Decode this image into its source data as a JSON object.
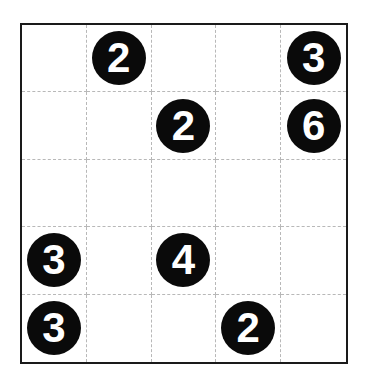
{
  "puzzle": {
    "rows": 5,
    "cols": 5,
    "grid": [
      [
        "",
        "2",
        "",
        "",
        "3"
      ],
      [
        "",
        "",
        "2",
        "",
        "6"
      ],
      [
        "",
        "",
        "",
        "",
        ""
      ],
      [
        "3",
        "",
        "4",
        "",
        ""
      ],
      [
        "3",
        "",
        "",
        "2",
        ""
      ]
    ]
  },
  "colors": {
    "clue_fill": "#0a0a0a",
    "clue_text": "#ffffff",
    "grid_line": "#b8b8b8",
    "border": "#1a1a1a"
  }
}
